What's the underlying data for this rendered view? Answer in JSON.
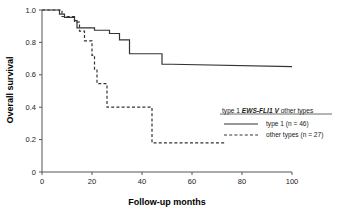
{
  "chart_data": {
    "type": "line",
    "title": "",
    "xlabel": "Follow-up months",
    "ylabel": "Overall survival",
    "xlim": [
      0,
      100
    ],
    "ylim": [
      0,
      1.0
    ],
    "xticks": [
      0,
      20,
      40,
      60,
      80,
      100
    ],
    "xtick_labels": [
      "0",
      "20",
      "40",
      "60",
      "80",
      "100"
    ],
    "yticks": [
      0,
      0.2,
      0.4,
      0.6,
      0.8,
      1.0
    ],
    "ytick_labels": [
      "0",
      "0.2",
      "0.4",
      "0.6",
      "0.8",
      "1.0"
    ],
    "grid": false,
    "legend_position": "right-middle",
    "legend_title_plain_1": "type 1 ",
    "legend_title_italic": "EWS-FLI1 V",
    "legend_title_plain_2": " other types",
    "series": [
      {
        "name": "type 1 (n = 46)",
        "style": "solid",
        "color": "#333333",
        "n": 46,
        "steps": [
          [
            0,
            1.0
          ],
          [
            7,
            1.0
          ],
          [
            7,
            0.975
          ],
          [
            9,
            0.975
          ],
          [
            9,
            0.955
          ],
          [
            13,
            0.955
          ],
          [
            13,
            0.935
          ],
          [
            14,
            0.935
          ],
          [
            14,
            0.89
          ],
          [
            21,
            0.89
          ],
          [
            21,
            0.875
          ],
          [
            27,
            0.875
          ],
          [
            27,
            0.855
          ],
          [
            31,
            0.855
          ],
          [
            31,
            0.815
          ],
          [
            35,
            0.815
          ],
          [
            35,
            0.73
          ],
          [
            48,
            0.73
          ],
          [
            48,
            0.665
          ],
          [
            52,
            0.665
          ],
          [
            100,
            0.65
          ]
        ]
      },
      {
        "name": "other types (n = 27)",
        "style": "dashed",
        "color": "#333333",
        "n": 27,
        "steps": [
          [
            0,
            1.0
          ],
          [
            8,
            1.0
          ],
          [
            8,
            0.96
          ],
          [
            13,
            0.96
          ],
          [
            13,
            0.925
          ],
          [
            15,
            0.925
          ],
          [
            15,
            0.87
          ],
          [
            17,
            0.87
          ],
          [
            17,
            0.81
          ],
          [
            20,
            0.81
          ],
          [
            20,
            0.72
          ],
          [
            21,
            0.72
          ],
          [
            21,
            0.635
          ],
          [
            22,
            0.635
          ],
          [
            22,
            0.545
          ],
          [
            26,
            0.545
          ],
          [
            26,
            0.4
          ],
          [
            44,
            0.4
          ],
          [
            44,
            0.18
          ],
          [
            73,
            0.18
          ]
        ]
      }
    ]
  }
}
